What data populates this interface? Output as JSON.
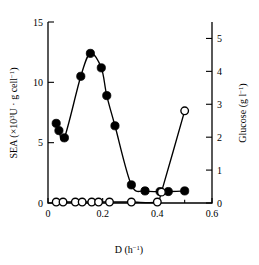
{
  "chart_data": {
    "type": "scatter",
    "title": "",
    "subtitle": "",
    "xlabel": "D (h⁻¹)",
    "ylabel": "SEA (×10³U · g cell⁻¹)",
    "y2label": "Glucose (g l⁻¹)",
    "xlim": [
      0,
      0.6
    ],
    "ylim": [
      0,
      15
    ],
    "y2lim": [
      0,
      5.5
    ],
    "xticks": [
      0,
      0.2,
      0.4,
      0.6
    ],
    "xticklabels": [
      "0",
      "0.2",
      "0.4",
      "0.6"
    ],
    "xminorticks": [
      0.1,
      0.3,
      0.5
    ],
    "yticks": [
      0,
      5,
      10,
      15
    ],
    "yticklabels": [
      "0",
      "5",
      "10",
      "15"
    ],
    "y2ticks": [
      0,
      1,
      2,
      3,
      4,
      5
    ],
    "y2ticklabels": [
      "0",
      "1",
      "2",
      "3",
      "4",
      "5"
    ],
    "grid": false,
    "legend_position": "none",
    "series": [
      {
        "name": "SEA",
        "axis": "left",
        "marker": "filled-circle",
        "line": true,
        "x": [
          0.03,
          0.04,
          0.06,
          0.12,
          0.155,
          0.195,
          0.215,
          0.245,
          0.305,
          0.355,
          0.41,
          0.44,
          0.5
        ],
        "y": [
          6.6,
          6.0,
          5.4,
          10.5,
          12.4,
          11.2,
          8.9,
          6.4,
          1.5,
          1.0,
          0.95,
          0.95,
          1.0
        ]
      },
      {
        "name": "Glucose",
        "axis": "right",
        "marker": "open-circle",
        "line": true,
        "x": [
          0.03,
          0.055,
          0.1,
          0.125,
          0.16,
          0.185,
          0.225,
          0.305,
          0.4,
          0.415,
          0.5
        ],
        "y": [
          0.03,
          0.03,
          0.03,
          0.03,
          0.03,
          0.03,
          0.03,
          0.03,
          0.03,
          0.33,
          2.8
        ]
      }
    ]
  },
  "figure": {
    "axis_left_title": "SEA (×10",
    "axis_left_title_sup": "3",
    "axis_left_title_mid": "U · g cell",
    "axis_left_title_sup2": "−1",
    "axis_left_title_end": ")",
    "axis_right_title": "Glucose (g l",
    "axis_right_title_sup": "−1",
    "axis_right_title_end": ")",
    "axis_x_title": "D (h",
    "axis_x_title_sup": "−1",
    "axis_x_title_end": ")"
  }
}
